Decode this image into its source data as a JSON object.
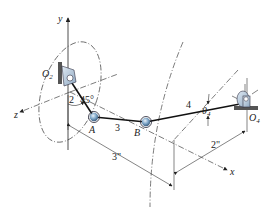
{
  "diagram": {
    "type": "spatial-linkage",
    "axes": {
      "x": "x",
      "y": "y",
      "z": "z"
    },
    "points": {
      "O2": {
        "label": "O",
        "sub": "2"
      },
      "A": {
        "label": "A"
      },
      "B": {
        "label": "B"
      },
      "O4": {
        "label": "O",
        "sub": "4"
      }
    },
    "links": {
      "link2": "2",
      "link3": "3",
      "link4": "4"
    },
    "angles": {
      "crank_angle": "45°",
      "theta4": {
        "label": "θ",
        "sub": "4"
      }
    },
    "dimensions": {
      "dim_3in": "3\"",
      "dim_2in": "2\""
    },
    "colors": {
      "joint_fill": "#7fa7c9",
      "bearing_fill": "#b9cde0",
      "line": "#111111"
    }
  }
}
